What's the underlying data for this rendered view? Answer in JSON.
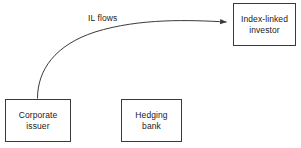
{
  "diagram": {
    "background_color": "#ffffff",
    "stroke_color": "#3a3a3a",
    "text_color": "#1a1a1a",
    "nodes": [
      {
        "id": "corporate-issuer",
        "label": "Corporate\nissuer",
        "shape": "rectangle"
      },
      {
        "id": "hedging-bank",
        "label": "Hedging\nbank",
        "shape": "rectangle"
      },
      {
        "id": "index-linked-investor",
        "label": "Index-linked\ninvestor",
        "shape": "rectangle"
      }
    ],
    "edges": [
      {
        "id": "il-flows",
        "label": "IL flows",
        "from": "corporate-issuer",
        "to": "index-linked-investor",
        "style": "curved",
        "arrowhead": "filled-triangle"
      }
    ]
  }
}
